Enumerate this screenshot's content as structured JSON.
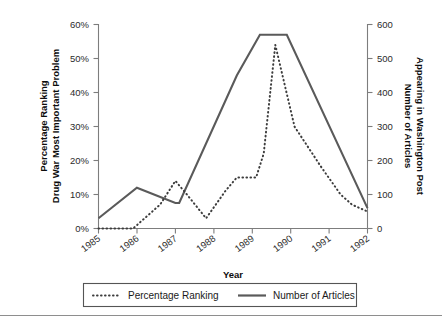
{
  "chart_data": {
    "type": "line",
    "title": "",
    "xlabel": "Year",
    "ylabel": "Percentage Ranking Drug War Most Important Problem",
    "ylabel_secondary": "Number of Articles Appearing in Washington Post",
    "grid": false,
    "legend_position": "bottom",
    "x": [
      1985,
      1985.5,
      1986,
      1986.5,
      1987,
      1987.5,
      1988,
      1988.5,
      1989,
      1989.4,
      1989.7,
      1990,
      1990.5,
      1991,
      1991.5,
      1992
    ],
    "xlim": [
      1985,
      1992
    ],
    "ylim": [
      0,
      0.6
    ],
    "ylim_secondary": [
      0,
      600
    ],
    "xtick_labels": [
      "1985",
      "1986",
      "1987",
      "1988",
      "1989",
      "1990",
      "1991",
      "1992"
    ],
    "xtick_values": [
      1985,
      1986,
      1987,
      1988,
      1989,
      1990,
      1991,
      1992
    ],
    "ytick_labels_left": [
      "0%",
      "10%",
      "20%",
      "30%",
      "40%",
      "50%",
      "60%"
    ],
    "ytick_values_left": [
      0,
      10,
      20,
      30,
      40,
      50,
      60
    ],
    "ytick_labels_right": [
      "0",
      "100",
      "200",
      "300",
      "400",
      "500",
      "600"
    ],
    "ytick_values_right": [
      0,
      100,
      200,
      300,
      400,
      500,
      600
    ],
    "series": [
      {
        "name": "Percentage Ranking",
        "axis": "left",
        "style": "dotted",
        "color": "#3d3d3d",
        "unit": "percent",
        "points": [
          {
            "x": 1985.0,
            "y": 0
          },
          {
            "x": 1985.9,
            "y": 0
          },
          {
            "x": 1986.6,
            "y": 7
          },
          {
            "x": 1987.0,
            "y": 14
          },
          {
            "x": 1987.3,
            "y": 10
          },
          {
            "x": 1987.8,
            "y": 3
          },
          {
            "x": 1988.3,
            "y": 11
          },
          {
            "x": 1988.6,
            "y": 15
          },
          {
            "x": 1989.1,
            "y": 15
          },
          {
            "x": 1989.3,
            "y": 22
          },
          {
            "x": 1989.6,
            "y": 54
          },
          {
            "x": 1990.1,
            "y": 30
          },
          {
            "x": 1990.8,
            "y": 18
          },
          {
            "x": 1991.3,
            "y": 10
          },
          {
            "x": 1991.6,
            "y": 7
          },
          {
            "x": 1992.0,
            "y": 5
          }
        ]
      },
      {
        "name": "Number of Articles",
        "axis": "right",
        "style": "solid",
        "color": "#5a5a5a",
        "unit": "articles",
        "points": [
          {
            "x": 1985.0,
            "y": 30
          },
          {
            "x": 1986.0,
            "y": 120
          },
          {
            "x": 1987.0,
            "y": 75
          },
          {
            "x": 1987.1,
            "y": 75
          },
          {
            "x": 1988.6,
            "y": 450
          },
          {
            "x": 1989.2,
            "y": 570
          },
          {
            "x": 1989.9,
            "y": 570
          },
          {
            "x": 1992.0,
            "y": 60
          }
        ]
      }
    ],
    "legend": [
      {
        "label": "Percentage Ranking",
        "style": "dotted"
      },
      {
        "label": "Number of Articles",
        "style": "solid"
      }
    ]
  }
}
